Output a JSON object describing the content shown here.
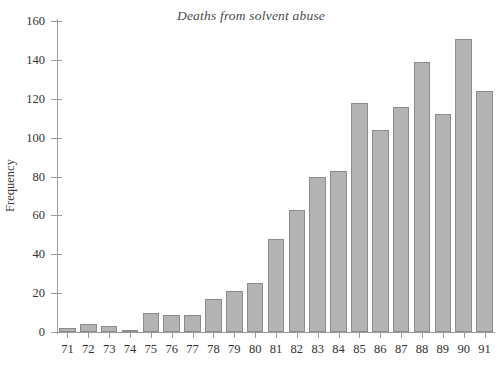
{
  "chart_data": {
    "type": "bar",
    "title": "Deaths from solvent abuse",
    "xlabel": "",
    "ylabel": "Frequency",
    "categories": [
      "71",
      "72",
      "73",
      "74",
      "75",
      "76",
      "77",
      "78",
      "79",
      "80",
      "81",
      "82",
      "83",
      "84",
      "85",
      "86",
      "87",
      "88",
      "89",
      "90",
      "91"
    ],
    "values": [
      2,
      4,
      3,
      1,
      10,
      9,
      9,
      17,
      21,
      25,
      48,
      63,
      80,
      83,
      118,
      104,
      116,
      139,
      112,
      151,
      124
    ],
    "ylim": [
      0,
      160
    ],
    "y_ticks": [
      0,
      20,
      40,
      60,
      80,
      100,
      120,
      140,
      160
    ],
    "y_tick_labels": [
      "0",
      "20",
      "40",
      "60",
      "80",
      "100",
      "120",
      "140",
      "160"
    ],
    "grid": false,
    "legend": null,
    "bar_color": "#b3b3b3",
    "bar_edge_color": "#8c8c8c",
    "axis_color": "#9a9a9a",
    "background_color": "#ffffff"
  }
}
